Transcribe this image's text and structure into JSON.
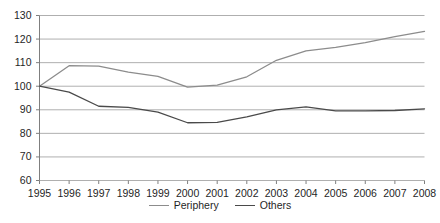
{
  "chart_data": {
    "type": "line",
    "title": "",
    "subtitle": "",
    "xlabel": "",
    "ylabel": "",
    "grid": true,
    "legend_position": "bottom-center",
    "xlim": [
      1995,
      2008
    ],
    "ylim": [
      60,
      130
    ],
    "ytick_step": 10,
    "categories": [
      "1995",
      "1996",
      "1997",
      "1998",
      "1999",
      "2000",
      "2001",
      "2002",
      "2003",
      "2004",
      "2005",
      "2006",
      "2007",
      "2008"
    ],
    "ytick_labels": [
      "130",
      "120",
      "110",
      "100",
      "90",
      "80",
      "70",
      "60"
    ],
    "ytick_values": [
      130,
      120,
      110,
      100,
      90,
      80,
      70,
      60
    ],
    "series": [
      {
        "name": "Periphery",
        "color": "#8c8c8c",
        "values": [
          100,
          108.7,
          108.5,
          106,
          104.2,
          99.6,
          100.5,
          104,
          111,
          115,
          116.5,
          118.5,
          121,
          123.3
        ]
      },
      {
        "name": "Others",
        "color": "#4a4a4a",
        "values": [
          100,
          97.5,
          91.5,
          91,
          89,
          84.5,
          84.7,
          87,
          90,
          91.2,
          89.5,
          89.5,
          89.7,
          90.4
        ]
      }
    ]
  },
  "legend": {
    "items": [
      {
        "label": "Periphery",
        "color": "#8c8c8c"
      },
      {
        "label": "Others",
        "color": "#4a4a4a"
      }
    ]
  },
  "axes": {
    "grid_color": "#a6a6a6",
    "axis_color": "#7f7f7f"
  }
}
